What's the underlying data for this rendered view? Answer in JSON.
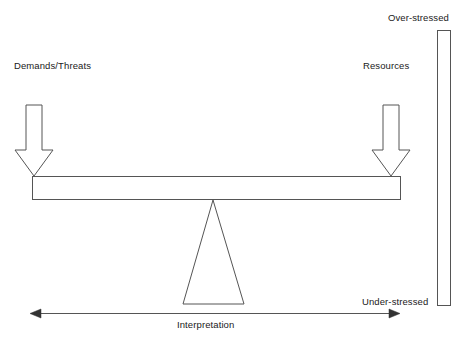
{
  "diagram": {
    "labels": {
      "demands": "Demands/Threats",
      "resources": "Resources",
      "over_stressed": "Over-stressed",
      "under_stressed": "Under-stressed",
      "interpretation": "Interpretation"
    },
    "icons": {
      "left_arrow_down": "arrow-down-icon",
      "right_arrow_down": "arrow-down-icon",
      "horizontal_double_arrow": "double-arrow-horizontal-icon",
      "fulcrum": "triangle-icon",
      "beam": "beam-icon",
      "gauge": "vertical-gauge-icon"
    },
    "colors": {
      "stroke": "#555555",
      "text": "#1a1a1a",
      "background": "#ffffff"
    }
  }
}
